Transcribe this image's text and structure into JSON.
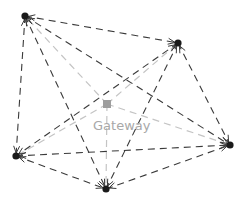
{
  "diagram": {
    "type": "network-mesh",
    "gateway": {
      "label": "Gateway",
      "x": 107,
      "y": 104,
      "color": "#9e9e9e",
      "label_x": 93,
      "label_y": 118
    },
    "nodes": [
      {
        "id": "n1",
        "x": 25,
        "y": 16
      },
      {
        "id": "n2",
        "x": 178,
        "y": 43
      },
      {
        "id": "n3",
        "x": 230,
        "y": 145
      },
      {
        "id": "n4",
        "x": 16,
        "y": 156
      },
      {
        "id": "n5",
        "x": 106,
        "y": 189
      }
    ],
    "node_color": "#1a1a1a",
    "mesh_edge_color": "#3a3a3a",
    "gateway_edge_color": "#c4c4c4",
    "mesh_edges": [
      [
        "n1",
        "n2"
      ],
      [
        "n1",
        "n3"
      ],
      [
        "n1",
        "n4"
      ],
      [
        "n1",
        "n5"
      ],
      [
        "n2",
        "n3"
      ],
      [
        "n2",
        "n4"
      ],
      [
        "n2",
        "n5"
      ],
      [
        "n4",
        "n3"
      ],
      [
        "n4",
        "n5"
      ],
      [
        "n5",
        "n3"
      ]
    ],
    "gateway_edges": [
      [
        "gw",
        "n1"
      ],
      [
        "gw",
        "n2"
      ],
      [
        "gw",
        "n3"
      ],
      [
        "gw",
        "n4"
      ],
      [
        "gw",
        "n5"
      ]
    ]
  }
}
